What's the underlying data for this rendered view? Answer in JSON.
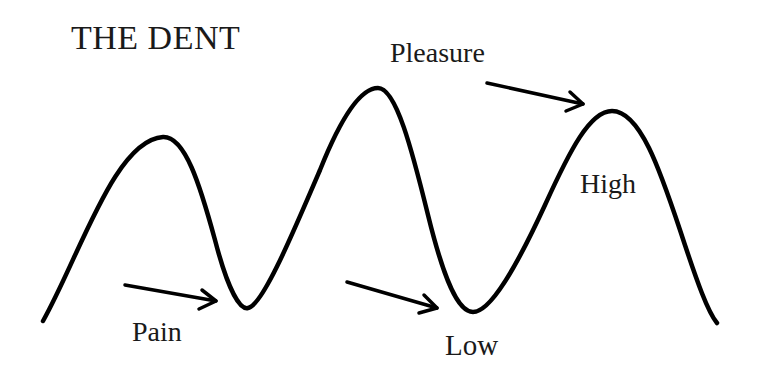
{
  "diagram": {
    "title": "THE DENT",
    "labels": {
      "pleasure": "Pleasure",
      "pain": "Pain",
      "low": "Low",
      "high": "High"
    },
    "colors": {
      "background": "#ffffff",
      "stroke": "#000000",
      "text": "#1a1a1a"
    },
    "curve": {
      "description": "Wave curve with three peaks and two troughs",
      "points": [
        {
          "name": "start",
          "x": 43,
          "y": 321
        },
        {
          "name": "peak-1",
          "x": 163,
          "y": 137
        },
        {
          "name": "trough-1",
          "x": 248,
          "y": 308
        },
        {
          "name": "peak-2",
          "x": 378,
          "y": 88
        },
        {
          "name": "trough-2",
          "x": 473,
          "y": 312
        },
        {
          "name": "peak-3",
          "x": 612,
          "y": 111
        },
        {
          "name": "end",
          "x": 717,
          "y": 323
        }
      ]
    },
    "arrows": [
      {
        "name": "pleasure-arrow",
        "points_to": "peak-3",
        "from": [
          487,
          83
        ],
        "to": [
          583,
          104
        ]
      },
      {
        "name": "pain-arrow",
        "points_to": "trough-1",
        "from": [
          125,
          285
        ],
        "to": [
          216,
          301
        ]
      },
      {
        "name": "low-arrow",
        "points_to": "trough-2",
        "from": [
          347,
          282
        ],
        "to": [
          437,
          308
        ]
      }
    ]
  }
}
